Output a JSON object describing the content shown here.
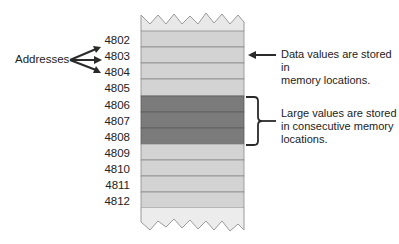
{
  "diagram": {
    "addresses_label": "Addresses",
    "cells": [
      {
        "address": "4802",
        "shade": "light"
      },
      {
        "address": "4803",
        "shade": "light"
      },
      {
        "address": "4804",
        "shade": "light"
      },
      {
        "address": "4805",
        "shade": "light"
      },
      {
        "address": "4806",
        "shade": "dark"
      },
      {
        "address": "4807",
        "shade": "dark"
      },
      {
        "address": "4808",
        "shade": "dark"
      },
      {
        "address": "4809",
        "shade": "light"
      },
      {
        "address": "4810",
        "shade": "light"
      },
      {
        "address": "4811",
        "shade": "light"
      },
      {
        "address": "4812",
        "shade": "light"
      }
    ],
    "note_data_values": {
      "line1": "Data values are stored in",
      "line2": "memory locations."
    },
    "note_large_values": {
      "line1": "Large values are stored",
      "line2": "in consecutive memory",
      "line3": "locations."
    },
    "colors": {
      "light_cell": "#d3d3d3",
      "dark_cell": "#7b7b7b",
      "cell_border": "#8c8c8c",
      "torn_edge": "#e6e6e6",
      "arrow": "#2a2a2a"
    }
  }
}
